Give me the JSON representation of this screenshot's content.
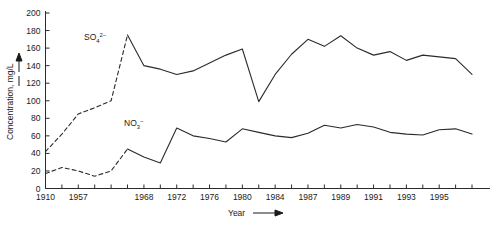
{
  "chart_data": {
    "type": "line",
    "title": "",
    "xlabel": "Year",
    "ylabel": "Concentration, mg/L",
    "ylim": [
      0,
      200
    ],
    "ytick_values": [
      0,
      20,
      40,
      60,
      80,
      100,
      120,
      140,
      160,
      180,
      200
    ],
    "ytick_labels": [
      "0",
      "20",
      "40",
      "60",
      "80",
      "100",
      "120",
      "140",
      "160",
      "180",
      "200"
    ],
    "xtick_labels": [
      "1910",
      "1957",
      "1968",
      "1972",
      "1976",
      "1980",
      "1984",
      "1987",
      "1989",
      "1991",
      "1993",
      "1995"
    ],
    "grid": false,
    "legend_position": "inline-annotation",
    "series": [
      {
        "name": "SO4 2-",
        "label_main": "SO",
        "label_sub": "4",
        "label_sup": "2−",
        "style": "mixed-dashed-then-solid",
        "dashed_until_index": 5,
        "x": [
          0,
          1,
          2,
          3,
          4,
          5,
          6,
          7,
          8,
          9,
          10,
          11,
          12,
          13,
          14,
          15,
          16,
          17,
          18,
          19,
          20,
          21,
          22,
          23,
          24,
          25,
          26
        ],
        "values": [
          42,
          62,
          85,
          92,
          100,
          175,
          140,
          136,
          130,
          134,
          143,
          152,
          159,
          99,
          130,
          153,
          170,
          162,
          174,
          160,
          152,
          156,
          146,
          152,
          150,
          148,
          130
        ],
        "x_year_labels": [
          "1910",
          "",
          "1957",
          "",
          "",
          "",
          "1968",
          "",
          "1972",
          "",
          "1976",
          "",
          "1980",
          "",
          "1984",
          "",
          "1987",
          "",
          "1989",
          "",
          "1991",
          "",
          "1993",
          "",
          "1995",
          "",
          ""
        ]
      },
      {
        "name": "NO3 -",
        "label_main": "NO",
        "label_sub": "3",
        "label_sup": "−",
        "style": "mixed-dashed-then-solid",
        "dashed_until_index": 5,
        "x": [
          0,
          1,
          2,
          3,
          4,
          5,
          6,
          7,
          8,
          9,
          10,
          11,
          12,
          13,
          14,
          15,
          16,
          17,
          18,
          19,
          20,
          21,
          22,
          23,
          24,
          25,
          26
        ],
        "values": [
          17,
          24,
          20,
          14,
          20,
          45,
          36,
          29,
          69,
          60,
          57,
          53,
          68,
          64,
          60,
          58,
          63,
          72,
          69,
          73,
          70,
          64,
          62,
          61,
          67,
          68,
          62
        ],
        "x_year_labels": [
          "1910",
          "",
          "1957",
          "",
          "",
          "",
          "1968",
          "",
          "1972",
          "",
          "1976",
          "",
          "1980",
          "",
          "1984",
          "",
          "1987",
          "",
          "1989",
          "",
          "1991",
          "",
          "1993",
          "",
          "1995",
          "",
          ""
        ]
      }
    ],
    "annotations": [
      {
        "text": "SO4 2-",
        "x_px": 84,
        "y_px": 38
      },
      {
        "text": "NO3 -",
        "x_px": 124,
        "y_px": 124
      }
    ]
  },
  "axes": {
    "y_title": "Concentration, mg/L",
    "x_title": "Year",
    "y_arrow": "up-arrow",
    "x_arrow": "right-arrow"
  }
}
